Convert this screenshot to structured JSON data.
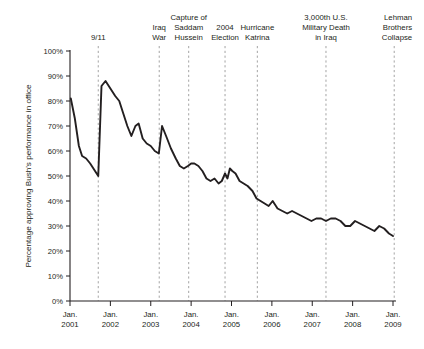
{
  "chart_data": {
    "type": "line",
    "title": "",
    "subtitle": "",
    "xlabel": "",
    "ylabel": "Percentage approving Bush's performance in office",
    "ylim": [
      0,
      100
    ],
    "xlim": [
      "Jan. 2001",
      "Jan. 2009"
    ],
    "grid": false,
    "legend": "none",
    "y_ticks": [
      "0%",
      "10%",
      "20%",
      "30%",
      "40%",
      "50%",
      "60%",
      "70%",
      "80%",
      "90%",
      "100%"
    ],
    "y_tick_values": [
      0,
      10,
      20,
      30,
      40,
      50,
      60,
      70,
      80,
      90,
      100
    ],
    "x_ticks": [
      "Jan.\n2001",
      "Jan.\n2002",
      "Jan.\n2003",
      "Jan.\n2004",
      "Jan.\n2005",
      "Jan.\n2006",
      "Jan.\n2007",
      "Jan.\n2008",
      "Jan.\n2009"
    ],
    "x_tick_lines": [
      {
        "line1": "Jan.",
        "line2": "2001"
      },
      {
        "line1": "Jan.",
        "line2": "2002"
      },
      {
        "line1": "Jan.",
        "line2": "2003"
      },
      {
        "line1": "Jan.",
        "line2": "2004"
      },
      {
        "line1": "Jan.",
        "line2": "2005"
      },
      {
        "line1": "Jan.",
        "line2": "2006"
      },
      {
        "line1": "Jan.",
        "line2": "2007"
      },
      {
        "line1": "Jan.",
        "line2": "2008"
      },
      {
        "line1": "Jan.",
        "line2": "2009"
      }
    ],
    "x_tick_years": [
      2001,
      2002,
      2003,
      2004,
      2005,
      2006,
      2007,
      2008,
      2009
    ],
    "series": [
      {
        "name": "Bush approval",
        "color": "#231f20",
        "x": [
          2001.02,
          2001.12,
          2001.22,
          2001.3,
          2001.4,
          2001.5,
          2001.62,
          2001.7,
          2001.78,
          2001.88,
          2002.0,
          2002.12,
          2002.22,
          2002.32,
          2002.42,
          2002.52,
          2002.62,
          2002.7,
          2002.8,
          2002.9,
          2003.0,
          2003.1,
          2003.2,
          2003.28,
          2003.38,
          2003.5,
          2003.62,
          2003.72,
          2003.82,
          2003.92,
          2004.0,
          2004.08,
          2004.18,
          2004.28,
          2004.38,
          2004.48,
          2004.58,
          2004.68,
          2004.76,
          2004.84,
          2004.9,
          2004.96,
          2005.02,
          2005.1,
          2005.2,
          2005.3,
          2005.4,
          2005.52,
          2005.62,
          2005.72,
          2005.82,
          2005.92,
          2006.02,
          2006.14,
          2006.26,
          2006.38,
          2006.5,
          2006.62,
          2006.74,
          2006.86,
          2006.98,
          2007.1,
          2007.22,
          2007.34,
          2007.46,
          2007.58,
          2007.7,
          2007.82,
          2007.94,
          2008.06,
          2008.18,
          2008.3,
          2008.42,
          2008.54,
          2008.66,
          2008.78,
          2008.9,
          2009.0
        ],
        "y": [
          81,
          73,
          62,
          58,
          57,
          55,
          52,
          50,
          86,
          88,
          85,
          82,
          80,
          75,
          70,
          66,
          70,
          71,
          65,
          63,
          62,
          60,
          59,
          70,
          66,
          61,
          57,
          54,
          53,
          54,
          55,
          55,
          54,
          52,
          49,
          48,
          49,
          47,
          48,
          51,
          49,
          53,
          52,
          51,
          48,
          47,
          46,
          44,
          41,
          40,
          39,
          38,
          40,
          37,
          36,
          35,
          36,
          35,
          34,
          33,
          32,
          33,
          33,
          32,
          33,
          33,
          32,
          30,
          30,
          32,
          31,
          30,
          29,
          28,
          30,
          29,
          27,
          26
        ]
      }
    ],
    "annotations": [
      {
        "label": "9/11",
        "lines": [
          "9/11"
        ],
        "x": 2001.7,
        "align": "center"
      },
      {
        "label": "Iraq War",
        "lines": [
          "Iraq",
          "War"
        ],
        "x": 2003.21,
        "align": "center"
      },
      {
        "label": "Capture of Saddam Hussein",
        "lines": [
          "Capture of",
          "Saddam",
          "Hussein"
        ],
        "x": 2003.94,
        "align": "center"
      },
      {
        "label": "2004 Election",
        "lines": [
          "2004",
          "Election"
        ],
        "x": 2004.84,
        "align": "center"
      },
      {
        "label": "Hurricane Katrina",
        "lines": [
          "Hurricane",
          "Katrina"
        ],
        "x": 2005.64,
        "align": "center"
      },
      {
        "label": "3,000th U.S. Military Death in Iraq",
        "lines": [
          "3,000th U.S.",
          "Military Death",
          "in Iraq"
        ],
        "x": 2007.34,
        "align": "center"
      },
      {
        "label": "Lehman Brothers Collapse",
        "lines": [
          "Lehman",
          "Brothers",
          "Collapse"
        ],
        "x": 2009.03,
        "align": "center"
      }
    ]
  }
}
